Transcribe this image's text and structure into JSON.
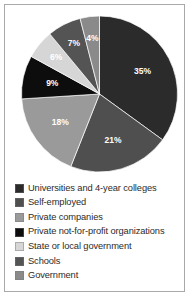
{
  "chart_data": {
    "type": "pie",
    "title": "",
    "subtitle": "",
    "xlabel": "",
    "ylabel": "",
    "legend_position": "bottom",
    "grid": false,
    "units": "percent",
    "total": 100,
    "categories": [
      "Universities and 4-year colleges",
      "Self-employed",
      "Private companies",
      "Private not-for-profit organizations",
      "State or local government",
      "Schools",
      "Government"
    ],
    "values": [
      35,
      21,
      18,
      9,
      6,
      7,
      4
    ],
    "data_labels": [
      "35%",
      "21%",
      "18%",
      "9%",
      "6%",
      "7%",
      "4%"
    ],
    "colors": [
      "#2b2b2b",
      "#4f4f4f",
      "#9a9a9a",
      "#0d0d0d",
      "#d6d6d6",
      "#545454",
      "#8a8a8a"
    ],
    "slices": [
      {
        "label": "Universities and 4-year colleges",
        "value": 35,
        "data_label": "35%",
        "color": "#2b2b2b"
      },
      {
        "label": "Self-employed",
        "value": 21,
        "data_label": "21%",
        "color": "#4f4f4f"
      },
      {
        "label": "Private companies",
        "value": 18,
        "data_label": "18%",
        "color": "#9a9a9a"
      },
      {
        "label": "Private not-for-profit organizations",
        "value": 9,
        "data_label": "9%",
        "color": "#0d0d0d"
      },
      {
        "label": "State or local government",
        "value": 6,
        "data_label": "6%",
        "color": "#d6d6d6"
      },
      {
        "label": "Schools",
        "value": 7,
        "data_label": "7%",
        "color": "#545454"
      },
      {
        "label": "Government",
        "value": 4,
        "data_label": "4%",
        "color": "#8a8a8a"
      }
    ]
  },
  "legend": {
    "items": [
      {
        "label": "Universities and 4-year colleges",
        "color": "#2b2b2b"
      },
      {
        "label": "Self-employed",
        "color": "#4f4f4f"
      },
      {
        "label": "Private companies",
        "color": "#9a9a9a"
      },
      {
        "label": "Private not-for-profit organizations",
        "color": "#0d0d0d"
      },
      {
        "label": "State or local government",
        "color": "#d6d6d6"
      },
      {
        "label": "Schools",
        "color": "#545454"
      },
      {
        "label": "Government",
        "color": "#8a8a8a"
      }
    ]
  },
  "frame": {
    "border_color": "#a9a9a9",
    "background": "#ffffff"
  }
}
